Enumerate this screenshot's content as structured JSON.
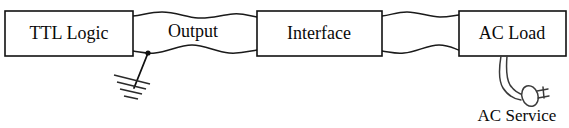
{
  "diagram": {
    "type": "block-diagram",
    "background_color": "#ffffff",
    "line_color": "#111111",
    "blocks": [
      {
        "id": "ttl-logic",
        "label": "TTL Logic",
        "x": 5,
        "y": 11,
        "width": 128,
        "height": 45
      },
      {
        "id": "interface",
        "label": "Interface",
        "x": 257,
        "y": 11,
        "width": 125,
        "height": 45
      },
      {
        "id": "ac-load",
        "label": "AC Load",
        "x": 459,
        "y": 11,
        "width": 107,
        "height": 45
      }
    ],
    "cables": [
      {
        "id": "output-cable",
        "label": "Output",
        "from": "ttl-logic",
        "to": "interface",
        "label_x": 193,
        "label_y": 33
      },
      {
        "id": "interface-load-cable",
        "label": "",
        "from": "interface",
        "to": "ac-load",
        "label_x": 420,
        "label_y": 33
      }
    ],
    "symbols": [
      {
        "id": "earth-ground",
        "name": "ground-symbol",
        "attached_to": "output-cable",
        "tap_x": 148,
        "tap_y": 54
      },
      {
        "id": "ac-plug",
        "name": "plug-symbol",
        "attached_to": "ac-load"
      }
    ],
    "annotations": [
      {
        "id": "ac-service",
        "label": "AC Service",
        "x": 517,
        "y": 117
      }
    ]
  }
}
